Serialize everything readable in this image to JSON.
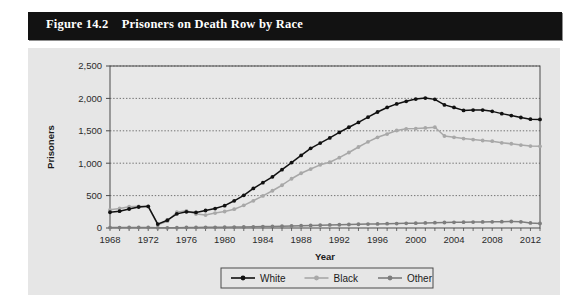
{
  "figure": {
    "number_label": "Figure 14.2",
    "title": "Prisoners on Death Row by Race",
    "title_full": "Figure 14.2    Prisoners on Death Row by Race"
  },
  "colors": {
    "title_bar_bg": "#121212",
    "title_text": "#ffffff",
    "panel_bg": "#e6e6e6",
    "plot_bg": "#e8e8e8",
    "axis_line": "#4a4a4a",
    "gridline": "#555555",
    "series_white": "#111111",
    "series_black": "#a8a8a8",
    "series_other": "#7d7d7d",
    "legend_border": "#4a4a4a"
  },
  "chart_data": {
    "type": "line",
    "title": "Prisoners on Death Row by Race",
    "xlabel": "Year",
    "ylabel": "Prisoners",
    "grid": true,
    "legend_position": "bottom",
    "xlim": [
      1968,
      2013
    ],
    "ylim": [
      0,
      2500
    ],
    "yticks": [
      0,
      500,
      1000,
      1500,
      2000,
      2500
    ],
    "ytick_labels": [
      "0",
      "500",
      "1,000",
      "1,500",
      "2,000",
      "2,500"
    ],
    "xticks": [
      1968,
      1972,
      1976,
      1980,
      1984,
      1988,
      1992,
      1996,
      2000,
      2004,
      2008,
      2012
    ],
    "xtick_labels": [
      "1968",
      "1972",
      "1976",
      "1980",
      "1984",
      "1988",
      "1992",
      "1996",
      "2000",
      "2004",
      "2008",
      "2012"
    ],
    "x": [
      1968,
      1969,
      1970,
      1971,
      1972,
      1973,
      1974,
      1975,
      1976,
      1977,
      1978,
      1979,
      1980,
      1981,
      1982,
      1983,
      1984,
      1985,
      1986,
      1987,
      1988,
      1989,
      1990,
      1991,
      1992,
      1993,
      1994,
      1995,
      1996,
      1997,
      1998,
      1999,
      2000,
      2001,
      2002,
      2003,
      2004,
      2005,
      2006,
      2007,
      2008,
      2009,
      2010,
      2011,
      2012,
      2013
    ],
    "series": [
      {
        "name": "White",
        "color": "#111111",
        "marker": "circle",
        "values": [
          243,
          260,
          293,
          324,
          334,
          60,
          120,
          218,
          250,
          240,
          270,
          300,
          345,
          420,
          505,
          610,
          700,
          790,
          900,
          1010,
          1120,
          1230,
          1310,
          1390,
          1475,
          1555,
          1630,
          1710,
          1790,
          1860,
          1915,
          1955,
          1990,
          2005,
          1985,
          1900,
          1860,
          1815,
          1820,
          1820,
          1800,
          1765,
          1735,
          1705,
          1680,
          1675
        ]
      },
      {
        "name": "Black",
        "color": "#a8a8a8",
        "marker": "circle",
        "values": [
          281,
          302,
          328,
          334,
          330,
          50,
          105,
          245,
          265,
          215,
          200,
          230,
          255,
          290,
          350,
          420,
          495,
          575,
          660,
          760,
          845,
          910,
          975,
          1015,
          1085,
          1165,
          1250,
          1330,
          1400,
          1450,
          1505,
          1530,
          1535,
          1545,
          1555,
          1420,
          1400,
          1380,
          1365,
          1350,
          1340,
          1315,
          1300,
          1280,
          1265,
          1260
        ]
      },
      {
        "name": "Other",
        "color": "#7d7d7d",
        "marker": "circle",
        "values": [
          6,
          7,
          8,
          9,
          9,
          2,
          3,
          5,
          8,
          9,
          10,
          11,
          12,
          14,
          16,
          18,
          22,
          25,
          28,
          32,
          36,
          40,
          44,
          47,
          50,
          54,
          58,
          60,
          63,
          66,
          69,
          72,
          75,
          78,
          82,
          85,
          88,
          90,
          92,
          94,
          96,
          98,
          100,
          95,
          78,
          70
        ]
      }
    ]
  },
  "legend": {
    "items": [
      {
        "label": "White",
        "color": "#111111"
      },
      {
        "label": "Black",
        "color": "#a8a8a8"
      },
      {
        "label": "Other",
        "color": "#7d7d7d"
      }
    ]
  }
}
